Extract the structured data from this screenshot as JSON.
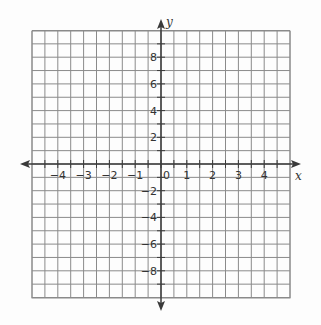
{
  "chart_data": {
    "type": "coordinate-grid",
    "title": "",
    "xlabel": "x",
    "ylabel": "y",
    "xlim": [
      -5,
      5
    ],
    "ylim": [
      -10,
      10
    ],
    "x_tick_labels": [
      "-4",
      "-3",
      "-2",
      "-1",
      "0",
      "1",
      "2",
      "3",
      "4"
    ],
    "y_tick_labels": [
      "8",
      "6",
      "4",
      "2",
      "-2",
      "-4",
      "-6",
      "-8"
    ],
    "x_grid_step": 0.5,
    "y_grid_step": 1,
    "grid": true,
    "series": []
  },
  "colors": {
    "grid": "#8a8a8a",
    "axis": "#3a3a3a",
    "background": "#fdfdfd"
  },
  "axes": {
    "x_label": "x",
    "y_label": "y",
    "origin_label": "0"
  }
}
